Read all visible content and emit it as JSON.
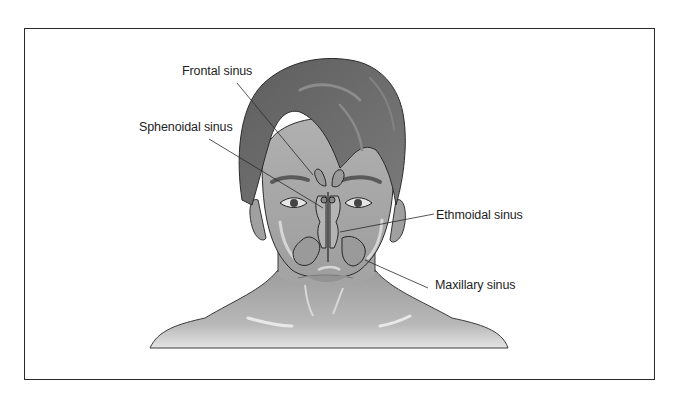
{
  "figure": {
    "labels": [
      {
        "id": "frontal",
        "text": "Frontal sinus"
      },
      {
        "id": "sphenoidal",
        "text": "Sphenoidal sinus"
      },
      {
        "id": "ethmoidal",
        "text": "Ethmoidal sinus"
      },
      {
        "id": "maxillary",
        "text": "Maxillary sinus"
      }
    ]
  },
  "colors": {
    "hair": "#6e6e6e",
    "skin": "#a9a9a9",
    "skin_light": "#c4c4c4",
    "outline": "#2b2b2b",
    "sinus_fill": "#9a9a9a",
    "frame": "#2a2a2a",
    "text": "#1e1e1e"
  }
}
